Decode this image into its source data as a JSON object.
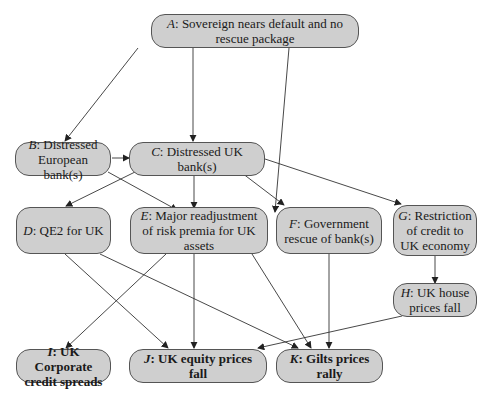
{
  "diagram": {
    "nodes": {
      "A": {
        "letter": "A",
        "text": ": Sovereign nears default and no rescue package"
      },
      "B": {
        "letter": "B",
        "text": ": Distressed European bank(s)"
      },
      "C": {
        "letter": "C",
        "text": ": Distressed UK bank(s)"
      },
      "D": {
        "letter": "D",
        "text": ": QE2 for UK"
      },
      "E": {
        "letter": "E",
        "text": ": Major readjustment of risk premia for UK assets"
      },
      "F": {
        "letter": "F",
        "text": ": Government rescue of bank(s)"
      },
      "G": {
        "letter": "G",
        "text": ": Restriction of credit to UK economy"
      },
      "H": {
        "letter": "H",
        "text": ": UK house prices fall"
      },
      "I": {
        "letter": "I",
        "text": ": UK Corporate credit spreads"
      },
      "J": {
        "letter": "J",
        "text": ": UK equity prices fall"
      },
      "K": {
        "letter": "K",
        "text": ": Gilts prices rally"
      }
    },
    "edges": [
      [
        "A",
        "B"
      ],
      [
        "A",
        "C"
      ],
      [
        "A",
        "E"
      ],
      [
        "B",
        "C"
      ],
      [
        "B",
        "E"
      ],
      [
        "C",
        "D"
      ],
      [
        "C",
        "E"
      ],
      [
        "C",
        "F"
      ],
      [
        "C",
        "G"
      ],
      [
        "D",
        "J"
      ],
      [
        "D",
        "K"
      ],
      [
        "E",
        "I"
      ],
      [
        "E",
        "J"
      ],
      [
        "E",
        "K"
      ],
      [
        "F",
        "K"
      ],
      [
        "G",
        "H"
      ],
      [
        "H",
        "J"
      ]
    ],
    "colors": {
      "node_fill": "#cfcfcf",
      "node_border": "#555555",
      "edge": "#333333"
    }
  }
}
